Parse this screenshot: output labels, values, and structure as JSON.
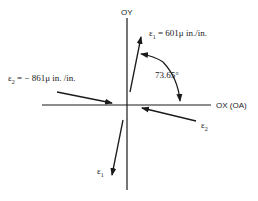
{
  "diagram": {
    "axes": {
      "y_label": "OY",
      "x_label": "OX (OA)"
    },
    "strain_1": {
      "symbol": "ε",
      "subscript": "1",
      "equation": " = 601μ in./in.",
      "value": 601,
      "unit": "μ in./in."
    },
    "strain_2": {
      "symbol": "ε",
      "subscript": "2",
      "equation": " = − 861μ in. /in.",
      "value": -861,
      "unit": "μ in./in."
    },
    "angle": {
      "label": "73.65°",
      "value_deg": 73.65
    },
    "lower_labels": {
      "eps1_symbol": "ε",
      "eps1_sub": "1",
      "eps2_symbol": "ε",
      "eps2_sub": "2"
    }
  }
}
